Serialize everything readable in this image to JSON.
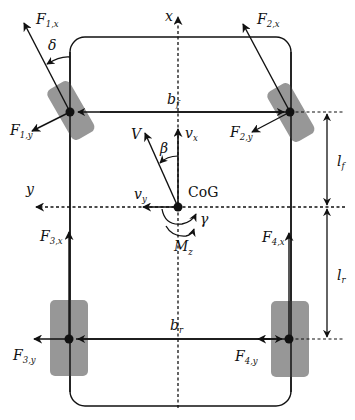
{
  "diagram": {
    "colors": {
      "line": "#111111",
      "wheel_fill": "#8c8c8c",
      "background": "#ffffff"
    },
    "axes": {
      "x": {
        "label": "x"
      },
      "y": {
        "label": "y"
      }
    },
    "center_of_gravity": {
      "label": "CoG"
    },
    "velocity": {
      "total": {
        "label": "V"
      },
      "longitudinal": {
        "label": "v",
        "sub": "x"
      },
      "lateral": {
        "label": "v",
        "sub": "y"
      },
      "sideslip_angle": {
        "label": "β"
      }
    },
    "yaw": {
      "rate": {
        "label": "γ"
      },
      "moment": {
        "label": "M",
        "sub": "z"
      }
    },
    "steering_angle": {
      "label": "δ"
    },
    "dimensions": {
      "front_track": {
        "label": "b",
        "sub": "f"
      },
      "rear_track": {
        "label": "b",
        "sub": "r"
      },
      "front_length": {
        "label": "l",
        "sub": "f"
      },
      "rear_length": {
        "label": "l",
        "sub": "r"
      }
    },
    "forces": {
      "F1x": {
        "label": "F",
        "sub": "1,x"
      },
      "F1y": {
        "label": "F",
        "sub": "1,y"
      },
      "F2x": {
        "label": "F",
        "sub": "2,x"
      },
      "F2y": {
        "label": "F",
        "sub": "2,y"
      },
      "F3x": {
        "label": "F",
        "sub": "3,x"
      },
      "F3y": {
        "label": "F",
        "sub": "3,y"
      },
      "F4x": {
        "label": "F",
        "sub": "4,x"
      },
      "F4y": {
        "label": "F",
        "sub": "4,y"
      }
    },
    "wheels": [
      {
        "id": 1,
        "position": "front-left",
        "steered": true
      },
      {
        "id": 2,
        "position": "front-right",
        "steered": true
      },
      {
        "id": 3,
        "position": "rear-left",
        "steered": false
      },
      {
        "id": 4,
        "position": "rear-right",
        "steered": false
      }
    ]
  }
}
